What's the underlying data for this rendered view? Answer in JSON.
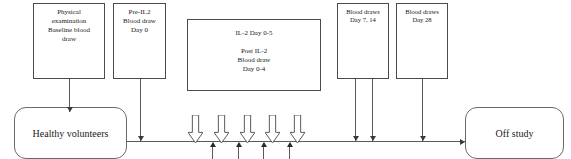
{
  "diagram": {
    "canvas": {
      "width": 571,
      "height": 159,
      "background": "#ffffff"
    },
    "colors": {
      "box_border": "#4a4a4a",
      "terminal_border": "#6a6a6a",
      "line": "#5a5a5a",
      "arrow": "#3a3a3a",
      "text": "#1a1a1a",
      "background": "#ffffff"
    },
    "process_boxes": [
      {
        "id": "physical-examination",
        "text": "Physical\nexamination\nBaseline blood\ndraw",
        "x": 33,
        "y": 3,
        "width": 72,
        "height": 76,
        "font_size": 7.0
      },
      {
        "id": "pre-il2",
        "text": "Pre-IL2\nBlood draw\nDay 0",
        "x": 113,
        "y": 3,
        "width": 53,
        "height": 76,
        "font_size": 7.0
      },
      {
        "id": "il2-treatment",
        "text": "IL-2 Day 0-5\n\nPost IL-2\nBlood draw\nDay 0-4",
        "x": 187,
        "y": 19,
        "width": 134,
        "height": 72,
        "font_size": 7.0
      },
      {
        "id": "blood-draws-day-7-14",
        "text": "Blood draws\nDay 7, 14",
        "x": 337,
        "y": 3,
        "width": 52,
        "height": 76,
        "font_size": 6.6
      },
      {
        "id": "blood-draws-day-28",
        "text": "Blood draws\nDay 28",
        "x": 396,
        "y": 3,
        "width": 52,
        "height": 76,
        "font_size": 6.6
      }
    ],
    "terminal_boxes": [
      {
        "id": "healthy-volunteers",
        "text": "Healthy volunteers",
        "x": 14,
        "y": 107,
        "width": 113,
        "height": 52,
        "font_size": 10
      },
      {
        "id": "off-study",
        "text": "Off study",
        "x": 465,
        "y": 107,
        "width": 99,
        "height": 52,
        "font_size": 10
      }
    ],
    "timeline": {
      "y": 141,
      "x_start": 127,
      "x_end": 465,
      "label": "study-timeline"
    },
    "down_connectors": [
      {
        "id": "physical-exam-to-volunteers",
        "x": 69,
        "y_top": 79,
        "y_bottom": 112
      },
      {
        "id": "pre-il2-to-timeline",
        "x": 140,
        "y_top": 79,
        "y_bottom": 141
      },
      {
        "id": "blood-draw-day7-to-timeline",
        "x": 355,
        "y_top": 79,
        "y_bottom": 141
      },
      {
        "id": "blood-draw-day14-to-timeline",
        "x": 372,
        "y_top": 79,
        "y_bottom": 141
      },
      {
        "id": "blood-draw-day28-to-timeline",
        "x": 422,
        "y_top": 79,
        "y_bottom": 141
      }
    ],
    "il2_dose_arrows": {
      "label": "IL-2 dose administration",
      "count": 5,
      "x_positions": [
        195,
        221,
        247,
        272,
        297
      ],
      "y_top": 115,
      "height": 28,
      "width": 15,
      "fill": "#ffffff",
      "stroke": "#5a5a5a"
    },
    "blood_draw_ticks": {
      "label": "Post IL-2 blood draw timepoints",
      "count": 4,
      "x_positions": [
        212,
        238,
        263,
        289
      ],
      "y_bottom": 159,
      "y_top": 143
    }
  }
}
